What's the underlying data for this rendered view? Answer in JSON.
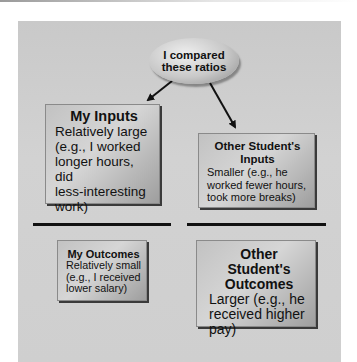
{
  "diagram": {
    "center_node": {
      "line1": "I compared",
      "line2": "these ratios"
    },
    "boxes": {
      "my_inputs": {
        "title": "My Inputs",
        "description": "Relatively large\n(e.g., I worked\nlonger hours, did\nless-interesting\nwork)"
      },
      "other_inputs": {
        "title": "Other Student's\nInputs",
        "description": "Smaller (e.g., he\nworked fewer hours,\ntook more breaks)"
      },
      "my_outcomes": {
        "title": "My Outcomes",
        "description": "Relatively small\n(e.g., I received\nlower salary)"
      },
      "other_outcomes": {
        "title": "Other Student's\nOutcomes",
        "description": "Larger (e.g., he\nreceived higher\npay)"
      }
    },
    "arrows": [
      {
        "from": "center_node",
        "to": "my_inputs"
      },
      {
        "from": "center_node",
        "to": "other_inputs"
      }
    ],
    "colors": {
      "panel": "#cfcfcf",
      "box": "#c2c2c2",
      "divider": "#111111",
      "arrow": "#111111"
    }
  }
}
